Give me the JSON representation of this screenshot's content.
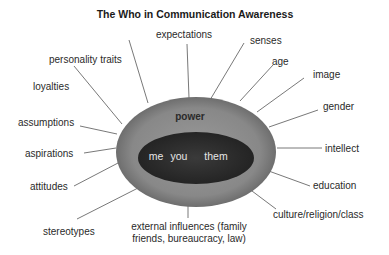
{
  "title": "The Who in Communication Awareness",
  "core": {
    "outer_label": "power",
    "inner_labels": [
      "me",
      "you",
      "them"
    ]
  },
  "labels": {
    "expectations": "expectations",
    "senses": "senses",
    "personality_traits": "personality traits",
    "age": "age",
    "image": "image",
    "loyalties": "loyalties",
    "gender": "gender",
    "assumptions": "assumptions",
    "intellect": "intellect",
    "aspirations": "aspirations",
    "attitudes": "attitudes",
    "education": "education",
    "culture": "culture/religion/class",
    "stereotypes": "stereotypes",
    "external_line1": "external influences (family",
    "external_line2": "friends, bureaucracy, law)"
  },
  "colors": {
    "outer_ellipse": "#8a8a8a",
    "inner_ellipse": "#2e2e2e",
    "lines": "#555555"
  }
}
